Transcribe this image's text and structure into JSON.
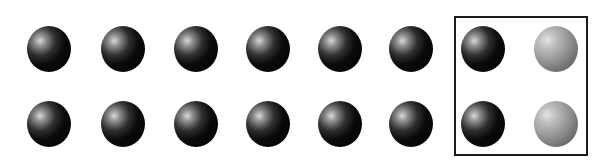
{
  "figure": {
    "rows": 2,
    "columns": 8,
    "balls": [
      {
        "row": 0,
        "col": 0,
        "shade": "dark",
        "cx": 49,
        "cy": 49
      },
      {
        "row": 0,
        "col": 1,
        "shade": "dark",
        "cx": 123,
        "cy": 49
      },
      {
        "row": 0,
        "col": 2,
        "shade": "dark",
        "cx": 196,
        "cy": 49
      },
      {
        "row": 0,
        "col": 3,
        "shade": "dark",
        "cx": 268,
        "cy": 49
      },
      {
        "row": 0,
        "col": 4,
        "shade": "dark",
        "cx": 340,
        "cy": 49
      },
      {
        "row": 0,
        "col": 5,
        "shade": "dark",
        "cx": 411,
        "cy": 49
      },
      {
        "row": 0,
        "col": 6,
        "shade": "dark",
        "cx": 483,
        "cy": 49
      },
      {
        "row": 0,
        "col": 7,
        "shade": "light",
        "cx": 556,
        "cy": 49
      },
      {
        "row": 1,
        "col": 0,
        "shade": "dark",
        "cx": 49,
        "cy": 124
      },
      {
        "row": 1,
        "col": 1,
        "shade": "dark",
        "cx": 123,
        "cy": 124
      },
      {
        "row": 1,
        "col": 2,
        "shade": "dark",
        "cx": 196,
        "cy": 124
      },
      {
        "row": 1,
        "col": 3,
        "shade": "dark",
        "cx": 268,
        "cy": 124
      },
      {
        "row": 1,
        "col": 4,
        "shade": "dark",
        "cx": 340,
        "cy": 124
      },
      {
        "row": 1,
        "col": 5,
        "shade": "dark",
        "cx": 411,
        "cy": 124
      },
      {
        "row": 1,
        "col": 6,
        "shade": "dark",
        "cx": 483,
        "cy": 124
      },
      {
        "row": 1,
        "col": 7,
        "shade": "light",
        "cx": 556,
        "cy": 124
      }
    ],
    "box": {
      "columns_enclosed": [
        6,
        7
      ],
      "border_color": "#1a1a1a"
    }
  }
}
